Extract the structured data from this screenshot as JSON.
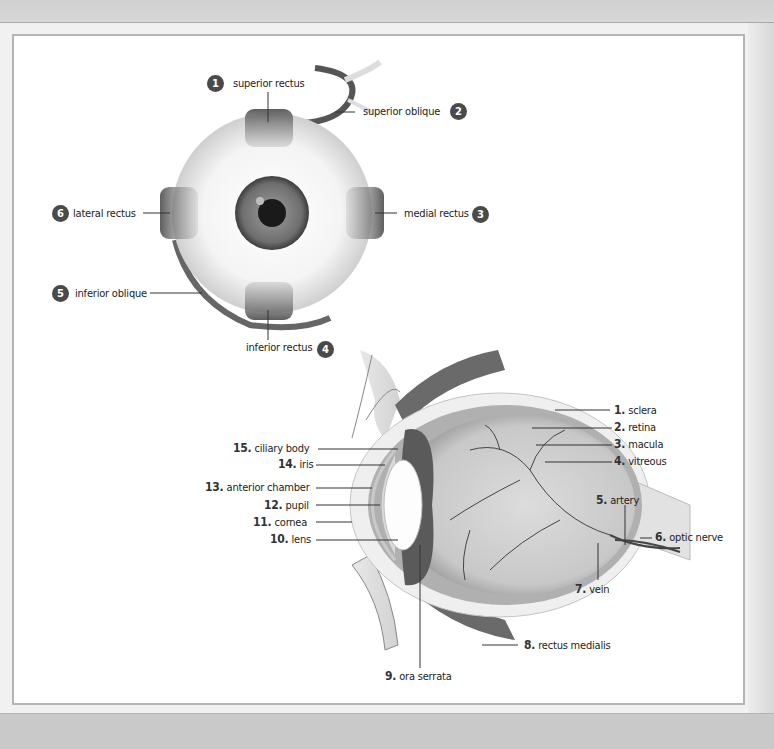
{
  "front_view": {
    "labels": [
      {
        "num": "1",
        "text": "superior rectus"
      },
      {
        "num": "2",
        "text": "superior oblique"
      },
      {
        "num": "3",
        "text": "medial rectus"
      },
      {
        "num": "4",
        "text": "inferior rectus"
      },
      {
        "num": "5",
        "text": "inferior oblique"
      },
      {
        "num": "6",
        "text": "lateral rectus"
      }
    ]
  },
  "cross_section": {
    "labels": [
      {
        "num": "1.",
        "text": "sclera"
      },
      {
        "num": "2.",
        "text": "retina"
      },
      {
        "num": "3.",
        "text": "macula"
      },
      {
        "num": "4.",
        "text": "vitreous"
      },
      {
        "num": "5.",
        "text": "artery"
      },
      {
        "num": "6.",
        "text": "optic nerve"
      },
      {
        "num": "7.",
        "text": "vein"
      },
      {
        "num": "8.",
        "text": "rectus medialis"
      },
      {
        "num": "9.",
        "text": "ora serrata"
      },
      {
        "num": "10.",
        "text": "lens"
      },
      {
        "num": "11.",
        "text": "cornea"
      },
      {
        "num": "12.",
        "text": "pupil"
      },
      {
        "num": "13.",
        "text": "anterior chamber"
      },
      {
        "num": "14.",
        "text": "iris"
      },
      {
        "num": "15.",
        "text": "ciliary body"
      }
    ]
  },
  "colors": {
    "badge": "#4a4a4a",
    "muscle": "#6f6f6f",
    "frame_border": "#b4b4b4"
  }
}
